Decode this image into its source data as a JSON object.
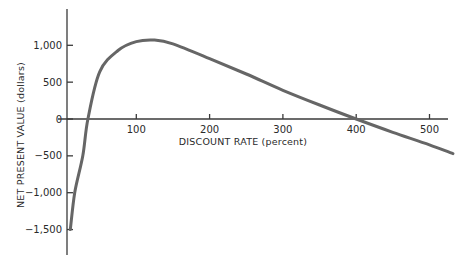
{
  "chart_data": {
    "type": "line",
    "title": "",
    "xlabel": "DISCOUNT RATE (percent)",
    "ylabel": "NET PRESENT VALUE (dollars)",
    "xlim": [
      0,
      530
    ],
    "ylim": [
      -1950,
      1450
    ],
    "x_ticks": [
      100,
      200,
      300,
      400,
      500
    ],
    "x_tick_labels": [
      "100",
      "200",
      "300",
      "400",
      "500"
    ],
    "y_ticks": [
      1000,
      500,
      0,
      -500,
      -1000,
      -1500
    ],
    "y_tick_labels": [
      "1,000",
      "500",
      "0",
      "−500",
      "−1,000",
      "−1,500"
    ],
    "grid": false,
    "legend": null,
    "series": [
      {
        "name": "NPV",
        "color": "#666666",
        "x": [
          10,
          16,
          27,
          34,
          50,
          75,
          100,
          125,
          150,
          200,
          250,
          300,
          350,
          400,
          450,
          500,
          532
        ],
        "values": [
          -1500,
          -1000,
          -500,
          0,
          640,
          930,
          1050,
          1070,
          1020,
          820,
          610,
          390,
          190,
          0,
          -180,
          -350,
          -470
        ]
      }
    ]
  }
}
